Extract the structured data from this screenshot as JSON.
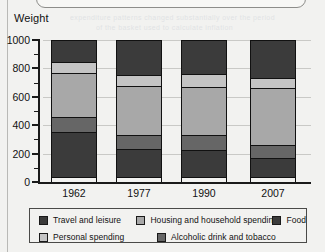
{
  "page": {
    "axis_title": "Weight",
    "ghost_text_1": "expenditure patterns changed substantially over the period",
    "ghost_text_2": "of the basket used to calculate inflation"
  },
  "chart_data": {
    "type": "bar",
    "subtype": "stacked",
    "title": "",
    "xlabel": "",
    "ylabel": "Weight",
    "categories": [
      "1962",
      "1977",
      "1990",
      "2007"
    ],
    "ylim": [
      0,
      1000
    ],
    "yticks": [
      0,
      200,
      400,
      600,
      800,
      1000
    ],
    "ytick_labels": [
      "0",
      "200",
      "400",
      "600",
      "800",
      "1000"
    ],
    "minor_tick_interval": 100,
    "grid": true,
    "legend_position": "bottom",
    "series": [
      {
        "name": "Food",
        "color": "#3b3b3b",
        "values": [
          325,
          205,
          195,
          140
        ]
      },
      {
        "name": "Alcoholic drink and tobacco",
        "color": "#666666",
        "values": [
          115,
          105,
          115,
          100
        ]
      },
      {
        "name": "Housing and household spending",
        "color": "#a8a8a8",
        "values": [
          310,
          350,
          345,
          405
        ]
      },
      {
        "name": "Personal spending",
        "color": "#c4c4c4",
        "values": [
          90,
          85,
          100,
          80
        ]
      },
      {
        "name": "Travel and leisure",
        "color": "#3b3b3b",
        "values": [
          160,
          255,
          245,
          275
        ]
      }
    ],
    "legend_entries": [
      {
        "label": "Travel and leisure",
        "color": "#3b3b3b"
      },
      {
        "label": "Housing and household spending",
        "color": "#a8a8a8"
      },
      {
        "label": "Food",
        "color": "#3b3b3b"
      },
      {
        "label": "Personal spending",
        "color": "#c4c4c4"
      },
      {
        "label": "Alcoholic drink and tobacco",
        "color": "#666666"
      }
    ]
  }
}
